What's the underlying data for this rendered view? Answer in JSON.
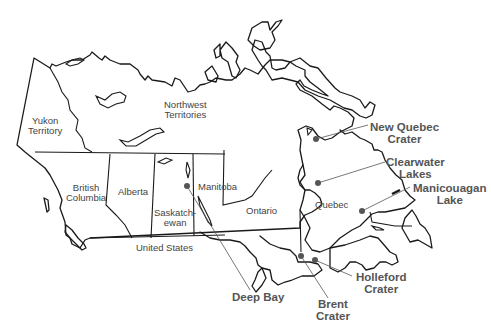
{
  "map": {
    "subject": "Canada impact craters",
    "colors": {
      "outline": "#1a1a1a",
      "crater_marker": "#555555",
      "label_text": "#444444",
      "crater_text": "#555555"
    },
    "regions": [
      {
        "id": "yukon",
        "line1": "Yukon",
        "line2": "Territory"
      },
      {
        "id": "nwt",
        "line1": "Northwest",
        "line2": "Territories"
      },
      {
        "id": "bc",
        "line1": "British",
        "line2": "Columbia"
      },
      {
        "id": "alberta",
        "line1": "Alberta"
      },
      {
        "id": "saskatchewan",
        "line1": "Saskatch-",
        "line2": "ewan"
      },
      {
        "id": "manitoba",
        "line1": "Manitoba"
      },
      {
        "id": "ontario",
        "line1": "Ontario"
      },
      {
        "id": "quebec",
        "line1": "Quebec"
      },
      {
        "id": "us",
        "line1": "United States"
      }
    ],
    "craters": [
      {
        "id": "new-quebec",
        "line1": "New Quebec",
        "line2": "Crater",
        "marker": [
          316,
          139
        ]
      },
      {
        "id": "clearwater",
        "line1": "Clearwater",
        "line2": "Lakes",
        "marker": [
          318,
          183
        ]
      },
      {
        "id": "manicouagan",
        "line1": "Manicouagan",
        "line2": "Lake",
        "marker": [
          362,
          211
        ]
      },
      {
        "id": "deep-bay",
        "line1": "Deep Bay",
        "marker": [
          187,
          186
        ]
      },
      {
        "id": "brent",
        "line1": "Brent",
        "line2": "Crater",
        "marker": [
          301,
          256
        ]
      },
      {
        "id": "holleford",
        "line1": "Holleford",
        "line2": "Crater",
        "marker": [
          315,
          260
        ]
      }
    ]
  }
}
